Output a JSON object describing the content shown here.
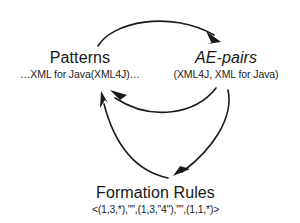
{
  "diagram": {
    "type": "cycle",
    "title": "",
    "background_color": "#ffffff",
    "stroke_color": "#1a1a1a",
    "nodes": [
      {
        "id": "patterns",
        "label": "Patterns",
        "sublabel": "…XML for Java(XML4J)…",
        "style": "regular",
        "position": "left"
      },
      {
        "id": "ae-pairs",
        "label": "AE-pairs",
        "sublabel": "(XML4J, XML for Java)",
        "style": "italic",
        "position": "right"
      },
      {
        "id": "formation-rules",
        "label": "Formation Rules",
        "sublabel": "<(1,3,*),\"\",(1,3,\"4\"),\"\",(1,1,*)>",
        "style": "regular",
        "position": "bottom"
      }
    ],
    "edges": [
      {
        "id": "patterns-to-ae-pairs",
        "from": "patterns",
        "to": "ae-pairs",
        "label": "",
        "shape": "arc-top"
      },
      {
        "id": "ae-pairs-to-formation-rules",
        "from": "ae-pairs",
        "to": "formation-rules",
        "label": "",
        "shape": "arc-right"
      },
      {
        "id": "formation-rules-to-patterns",
        "from": "formation-rules",
        "to": "patterns",
        "label": "",
        "shape": "arc-bottom-left"
      },
      {
        "id": "ae-pairs-to-patterns",
        "from": "ae-pairs",
        "to": "patterns",
        "label": "",
        "shape": "arc-middle"
      }
    ]
  }
}
